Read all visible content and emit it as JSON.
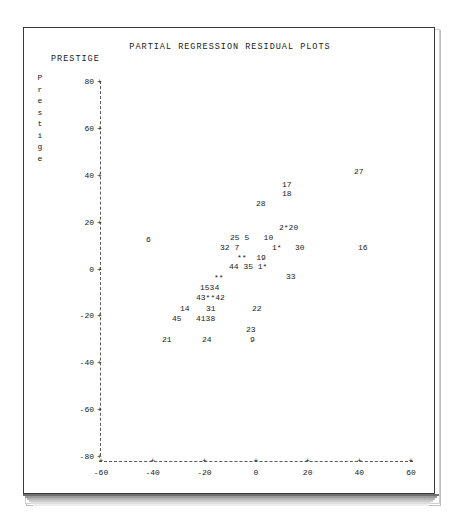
{
  "title": "PARTIAL REGRESSION RESIDUAL PLOTS",
  "y_axis": {
    "header": "PRESTIGE",
    "vertical_label": "Prestige",
    "vertical_label_chars": [
      "P",
      "r",
      "e",
      "s",
      "t",
      "i",
      "g",
      "e"
    ],
    "tick_marker": "+",
    "ticks": [
      "80",
      "60",
      "40",
      "20",
      "0",
      "-20",
      "-40",
      "-60",
      "-80"
    ]
  },
  "x_axis": {
    "label_left": "Income",
    "label_right": "INCOME",
    "tick_marker": "+",
    "ticks": [
      "-60",
      "-40",
      "-20",
      "0",
      "20",
      "40",
      "60"
    ]
  },
  "chart_data": {
    "type": "scatter",
    "title": "PARTIAL REGRESSION RESIDUAL PLOTS",
    "xlabel": "Income",
    "ylabel": "Prestige",
    "xlim": [
      -60,
      60
    ],
    "ylim": [
      -80,
      80
    ],
    "xticks": [
      -60,
      -40,
      -20,
      0,
      20,
      40,
      60
    ],
    "yticks": [
      -80,
      -60,
      -40,
      -20,
      0,
      20,
      40,
      60,
      80
    ],
    "grid": false,
    "legend": "none",
    "point_marker_note": "Points are plotted as their observation number; '*' marks overplotted/hidden observations.",
    "points": [
      {
        "label": "27",
        "x": 47,
        "y": 39
      },
      {
        "label": "17",
        "x": 14,
        "y": 36
      },
      {
        "label": "18",
        "x": 14,
        "y": 33
      },
      {
        "label": "28",
        "x": 6,
        "y": 28
      },
      {
        "label": "2",
        "x": 16,
        "y": 17
      },
      {
        "label": "*",
        "x": 18,
        "y": 17
      },
      {
        "label": "20",
        "x": 20,
        "y": 17
      },
      {
        "label": "6",
        "x": -34,
        "y": 12
      },
      {
        "label": "25",
        "x": 1,
        "y": 12
      },
      {
        "label": "5",
        "x": 4,
        "y": 12
      },
      {
        "label": "10",
        "x": 12,
        "y": 12
      },
      {
        "label": "32",
        "x": -2,
        "y": 8
      },
      {
        "label": "7",
        "x": 1,
        "y": 8
      },
      {
        "label": "1",
        "x": 10,
        "y": 8
      },
      {
        "label": "*",
        "x": 11,
        "y": 8
      },
      {
        "label": "30",
        "x": 17,
        "y": 8
      },
      {
        "label": "16",
        "x": 40,
        "y": 8
      },
      {
        "label": "*",
        "x": 3,
        "y": 4
      },
      {
        "label": "*",
        "x": 4,
        "y": 4
      },
      {
        "label": "19",
        "x": 9,
        "y": 4
      },
      {
        "label": "44",
        "x": 2,
        "y": 0
      },
      {
        "label": "35",
        "x": 6,
        "y": 0
      },
      {
        "label": "1",
        "x": 10,
        "y": 0
      },
      {
        "label": "*",
        "x": 11,
        "y": 0
      },
      {
        "label": "33",
        "x": 19,
        "y": -3
      },
      {
        "label": "*",
        "x": -6,
        "y": -5
      },
      {
        "label": "*",
        "x": -5,
        "y": -5
      },
      {
        "label": "15",
        "x": -9,
        "y": -9
      },
      {
        "label": "34",
        "x": -7,
        "y": -9
      },
      {
        "label": "43",
        "x": -9,
        "y": -12
      },
      {
        "label": "*",
        "x": -7,
        "y": -12
      },
      {
        "label": "*",
        "x": -6,
        "y": -12
      },
      {
        "label": "42",
        "x": -5,
        "y": -12
      },
      {
        "label": "14",
        "x": -14,
        "y": -15
      },
      {
        "label": "31",
        "x": -8,
        "y": -15
      },
      {
        "label": "22",
        "x": 3,
        "y": -15
      },
      {
        "label": "45",
        "x": -15,
        "y": -19
      },
      {
        "label": "41",
        "x": -10,
        "y": -19
      },
      {
        "label": "38",
        "x": -8,
        "y": -19
      },
      {
        "label": "23",
        "x": 2,
        "y": -23
      },
      {
        "label": "21",
        "x": -18,
        "y": -26
      },
      {
        "label": "24",
        "x": -10,
        "y": -26
      },
      {
        "label": "9",
        "x": 2,
        "y": -26
      }
    ]
  },
  "point_rows": [
    {
      "name": "row-27",
      "text": "27",
      "left": 330,
      "top": 140
    },
    {
      "name": "row-17",
      "text": "17",
      "left": 258,
      "top": 153
    },
    {
      "name": "row-18",
      "text": "18",
      "left": 258,
      "top": 162
    },
    {
      "name": "row-28",
      "text": "28",
      "left": 232,
      "top": 172
    },
    {
      "name": "row-2-20",
      "text": "2*20",
      "left": 255,
      "top": 196
    },
    {
      "name": "row-6",
      "text": "6",
      "left": 122,
      "top": 208
    },
    {
      "name": "row-25-5-10",
      "text": "25 5   10",
      "left": 206,
      "top": 206
    },
    {
      "name": "row-32-7",
      "text": "32 7",
      "left": 196,
      "top": 216
    },
    {
      "name": "row-1star",
      "text": "1*",
      "left": 248,
      "top": 216
    },
    {
      "name": "row-30",
      "text": "30",
      "left": 271,
      "top": 216
    },
    {
      "name": "row-16",
      "text": "16",
      "left": 334,
      "top": 216
    },
    {
      "name": "row-stars-19",
      "text": "**  19",
      "left": 213,
      "top": 226
    },
    {
      "name": "row-44-35-1",
      "text": "44 35 1*",
      "left": 205,
      "top": 235
    },
    {
      "name": "row-33",
      "text": "33",
      "left": 262,
      "top": 245
    },
    {
      "name": "row-stars-a",
      "text": "**",
      "left": 190,
      "top": 246
    },
    {
      "name": "row-1534",
      "text": "1534",
      "left": 176,
      "top": 256
    },
    {
      "name": "row-43-42",
      "text": "43**42",
      "left": 172,
      "top": 266
    },
    {
      "name": "row-14",
      "text": "14",
      "left": 156,
      "top": 277
    },
    {
      "name": "row-31",
      "text": "31",
      "left": 182,
      "top": 277
    },
    {
      "name": "row-22",
      "text": "22",
      "left": 228,
      "top": 277
    },
    {
      "name": "row-45",
      "text": "45",
      "left": 148,
      "top": 287
    },
    {
      "name": "row-4138",
      "text": "4138",
      "left": 172,
      "top": 287
    },
    {
      "name": "row-23",
      "text": "23",
      "left": 222,
      "top": 298
    },
    {
      "name": "row-21",
      "text": "21",
      "left": 138,
      "top": 308
    },
    {
      "name": "row-24",
      "text": "24",
      "left": 178,
      "top": 308
    },
    {
      "name": "row-9",
      "text": "9",
      "left": 226,
      "top": 308
    }
  ]
}
